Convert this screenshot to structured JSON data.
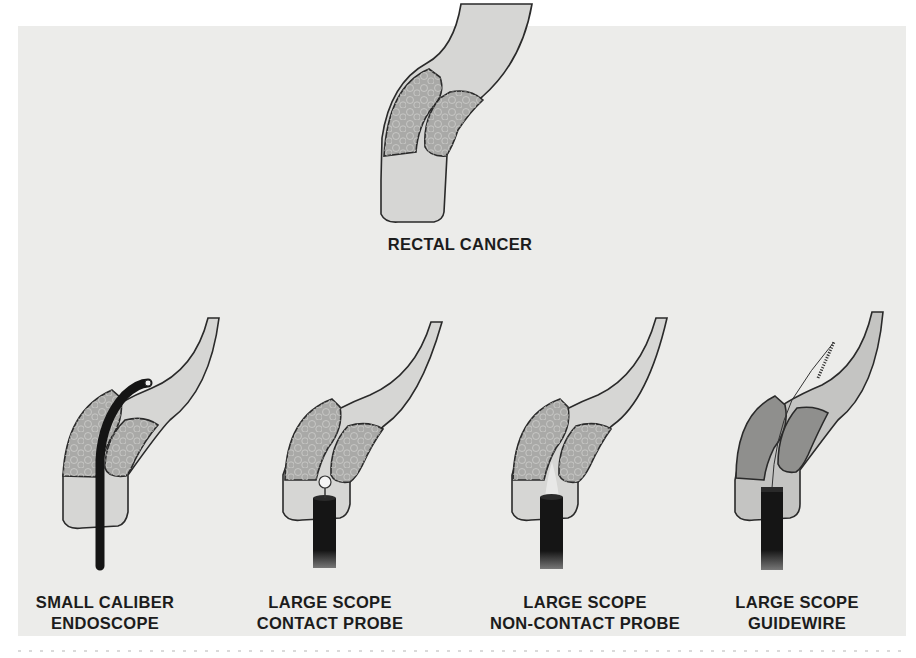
{
  "figure": {
    "title_label": "RECTAL CANCER",
    "panels": [
      {
        "id": "small-caliber",
        "line1": "SMALL CALIBER",
        "line2": "ENDOSCOPE"
      },
      {
        "id": "contact-probe",
        "line1": "LARGE SCOPE",
        "line2": "CONTACT PROBE"
      },
      {
        "id": "non-contact-probe",
        "line1": "LARGE SCOPE",
        "line2": "NON-CONTACT PROBE"
      },
      {
        "id": "guidewire",
        "line1": "LARGE SCOPE",
        "line2": "GUIDEWIRE"
      }
    ],
    "colors": {
      "background": "#ececea",
      "lumen": "#d6d6d4",
      "lumen_dark": "#c4c4c2",
      "tumor": "#a6a6a4",
      "tumor_dark": "#8c8c8a",
      "outline": "#2a2a2a",
      "scope": "#151515"
    }
  }
}
